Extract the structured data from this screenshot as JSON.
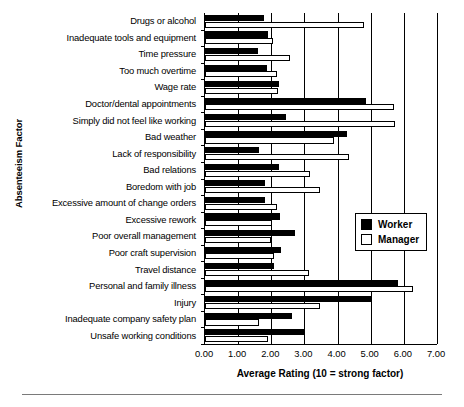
{
  "chart_data": {
    "type": "bar",
    "orientation": "horizontal",
    "title": "",
    "xlabel": "Average Rating (10 = strong factor)",
    "ylabel": "Absenteeism Factor",
    "xlim": [
      0,
      7
    ],
    "xticks": [
      "0.00",
      "1.00",
      "2.00",
      "3.00",
      "4.00",
      "5.00",
      "6.00",
      "7.00"
    ],
    "grid": true,
    "legend_position": "right-middle",
    "categories": [
      "Drugs or alcohol",
      "Inadequate tools and equipment",
      "Time pressure",
      "Too much overtime",
      "Wage rate",
      "Doctor/dental appointments",
      "Simply did not feel like working",
      "Bad weather",
      "Lack of responsibility",
      "Bad relations",
      "Boredom with job",
      "Excessive amount of change orders",
      "Excessive rework",
      "Poor overall management",
      "Poor craft supervision",
      "Travel distance",
      "Personal and family illness",
      "Injury",
      "Inadequate company safety plan",
      "Unsafe working conditions"
    ],
    "series": [
      {
        "name": "Worker",
        "color": "#000000",
        "values": [
          1.77,
          1.9,
          1.59,
          1.86,
          2.24,
          4.86,
          2.45,
          4.28,
          1.64,
          2.23,
          1.82,
          1.82,
          2.26,
          2.72,
          2.29,
          2.07,
          5.82,
          5.03,
          2.62,
          3.02
        ]
      },
      {
        "name": "Manager",
        "color": "#ffffff",
        "values": [
          4.81,
          2.04,
          2.55,
          2.17,
          2.21,
          5.7,
          5.72,
          3.88,
          4.34,
          3.18,
          3.48,
          2.17,
          2.01,
          1.99,
          2.07,
          3.15,
          6.28,
          3.47,
          1.64,
          1.89
        ]
      }
    ]
  },
  "legend": {
    "items": [
      {
        "label": "Worker",
        "swatch": "filled-black-square"
      },
      {
        "label": "Manager",
        "swatch": "open-white-square"
      }
    ]
  }
}
